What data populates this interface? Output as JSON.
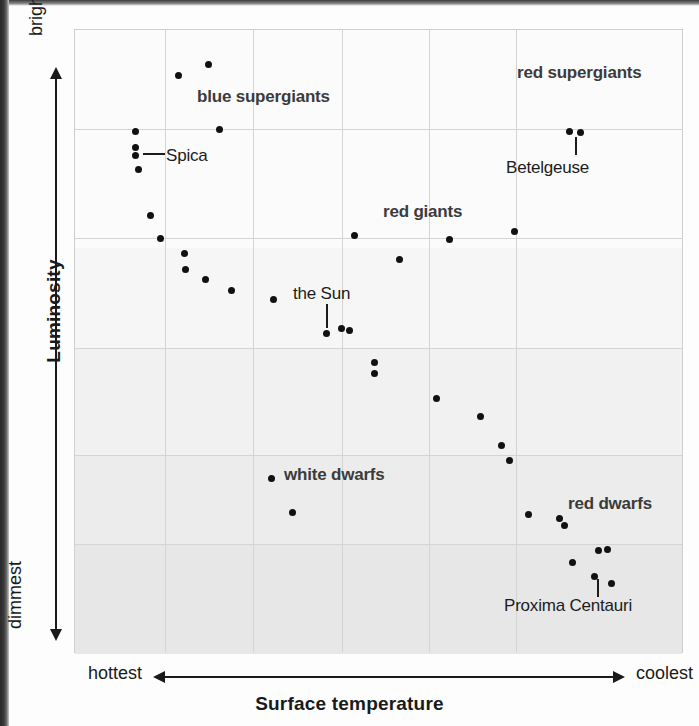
{
  "figure": {
    "kind": "hertzsprung-russell-diagram",
    "background_color": "#f2f2f2",
    "dot_color": "#111111",
    "grid_color": "#d4d4d4"
  },
  "axes": {
    "y": {
      "title": "Luminosity",
      "top_label": "brightest",
      "bottom_label": "dimmest"
    },
    "x": {
      "title": "Surface temperature",
      "left_label": "hottest",
      "right_label": "coolest"
    }
  },
  "annotations": [
    {
      "name": "blue-supergiants",
      "text": "blue supergiants",
      "x": 196,
      "y": 86,
      "bold": true
    },
    {
      "name": "red-supergiants",
      "text": "red supergiants",
      "x": 516,
      "y": 62,
      "bold": true
    },
    {
      "name": "spica",
      "text": "Spica",
      "x": 165,
      "y": 145,
      "bold": false
    },
    {
      "name": "betelgeuse",
      "text": "Betelgeuse",
      "x": 505,
      "y": 157,
      "bold": false
    },
    {
      "name": "red-giants",
      "text": "red giants",
      "x": 382,
      "y": 201,
      "bold": true
    },
    {
      "name": "the-sun",
      "text": "the Sun",
      "x": 292,
      "y": 283,
      "bold": false
    },
    {
      "name": "white-dwarfs",
      "text": "white dwarfs",
      "x": 283,
      "y": 464,
      "bold": true
    },
    {
      "name": "red-dwarfs",
      "text": "red dwarfs",
      "x": 567,
      "y": 493,
      "bold": true
    },
    {
      "name": "proxima-centauri",
      "text": "Proxima Centauri",
      "x": 503,
      "y": 595,
      "bold": false
    }
  ],
  "leaders": [
    {
      "name": "spica-leader",
      "orientation": "h",
      "x": 142,
      "y": 152,
      "length": 22
    },
    {
      "name": "betelgeuse-leader",
      "orientation": "v",
      "x": 574,
      "y": 136,
      "length": 18
    },
    {
      "name": "sun-leader",
      "orientation": "v",
      "x": 325,
      "y": 303,
      "length": 24
    },
    {
      "name": "proxima-leader",
      "orientation": "v",
      "x": 596,
      "y": 578,
      "length": 18
    }
  ],
  "chart_data": {
    "type": "scatter",
    "xlabel": "Surface temperature",
    "ylabel": "Luminosity",
    "xlim": [
      "hottest",
      "coolest"
    ],
    "ylim": [
      "dimmest",
      "brightest"
    ],
    "grid": true,
    "legend": "none",
    "axis_notes": "Temperature decreases left to right; luminosity increases bottom to top. Axes are unlabeled qualitative scales.",
    "plot_box_px": {
      "left": 74,
      "top": 29,
      "width": 609,
      "height": 624
    },
    "gridlines_px": {
      "vertical": [
        164,
        252,
        341,
        428,
        515
      ],
      "horizontal": [
        128,
        237,
        347,
        454,
        543
      ]
    },
    "shading_bands_px": [
      {
        "top": 0,
        "height": 218,
        "color": "#fbfbfb"
      },
      {
        "top": 218,
        "height": 100,
        "color": "#f6f6f6"
      },
      {
        "top": 318,
        "height": 107,
        "color": "#f1f1f1"
      },
      {
        "top": 425,
        "height": 89,
        "color": "#ececec"
      },
      {
        "top": 514,
        "height": 110,
        "color": "#e7e7e7"
      }
    ],
    "groups": [
      {
        "name": "blue supergiants",
        "points_px": [
          {
            "x": 177,
            "y": 74
          },
          {
            "x": 207,
            "y": 63
          },
          {
            "x": 218,
            "y": 128
          }
        ]
      },
      {
        "name": "main sequence (hot / upper left)",
        "points_px": [
          {
            "x": 134,
            "y": 130
          },
          {
            "x": 134,
            "y": 146
          },
          {
            "x": 134,
            "y": 154
          },
          {
            "x": 137,
            "y": 168
          },
          {
            "x": 149,
            "y": 214
          },
          {
            "x": 159,
            "y": 237
          },
          {
            "x": 183,
            "y": 252
          },
          {
            "x": 184,
            "y": 268
          },
          {
            "x": 204,
            "y": 278
          },
          {
            "x": 230,
            "y": 289
          },
          {
            "x": 272,
            "y": 298
          }
        ]
      },
      {
        "name": "main sequence (solar / middle)",
        "points_px": [
          {
            "x": 325,
            "y": 332
          },
          {
            "x": 340,
            "y": 327
          },
          {
            "x": 348,
            "y": 329
          },
          {
            "x": 373,
            "y": 361
          },
          {
            "x": 373,
            "y": 372
          },
          {
            "x": 435,
            "y": 397
          },
          {
            "x": 479,
            "y": 415
          },
          {
            "x": 500,
            "y": 444
          },
          {
            "x": 508,
            "y": 459
          }
        ]
      },
      {
        "name": "red giants",
        "points_px": [
          {
            "x": 353,
            "y": 234
          },
          {
            "x": 398,
            "y": 258
          },
          {
            "x": 448,
            "y": 238
          },
          {
            "x": 513,
            "y": 230
          }
        ]
      },
      {
        "name": "red supergiants (Betelgeuse)",
        "points_px": [
          {
            "x": 568,
            "y": 130
          },
          {
            "x": 579,
            "y": 131
          }
        ]
      },
      {
        "name": "white dwarfs",
        "points_px": [
          {
            "x": 270,
            "y": 477
          },
          {
            "x": 291,
            "y": 511
          }
        ]
      },
      {
        "name": "red dwarfs",
        "points_px": [
          {
            "x": 527,
            "y": 513
          },
          {
            "x": 558,
            "y": 517
          },
          {
            "x": 563,
            "y": 524
          },
          {
            "x": 597,
            "y": 549
          },
          {
            "x": 606,
            "y": 548
          },
          {
            "x": 571,
            "y": 561
          },
          {
            "x": 593,
            "y": 575
          },
          {
            "x": 610,
            "y": 582
          }
        ]
      }
    ],
    "named_stars": [
      {
        "label": "Spica",
        "x": 134,
        "y": 150
      },
      {
        "label": "Betelgeuse",
        "x": 574,
        "y": 130
      },
      {
        "label": "the Sun",
        "x": 325,
        "y": 332
      },
      {
        "label": "Proxima Centauri",
        "x": 596,
        "y": 564
      }
    ]
  }
}
